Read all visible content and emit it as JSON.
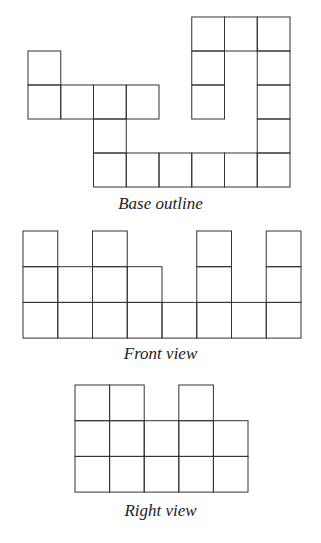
{
  "figures": [
    {
      "id": "base",
      "caption": "Base outline",
      "origin": [
        28,
        17
      ],
      "cell": [
        32.75,
        34
      ],
      "cells": [
        [
          5,
          0
        ],
        [
          6,
          0
        ],
        [
          7,
          0
        ],
        [
          0,
          1
        ],
        [
          5,
          1
        ],
        [
          7,
          1
        ],
        [
          0,
          2
        ],
        [
          1,
          2
        ],
        [
          2,
          2
        ],
        [
          3,
          2
        ],
        [
          5,
          2
        ],
        [
          7,
          2
        ],
        [
          2,
          3
        ],
        [
          7,
          3
        ],
        [
          2,
          4
        ],
        [
          3,
          4
        ],
        [
          4,
          4
        ],
        [
          5,
          4
        ],
        [
          6,
          4
        ],
        [
          7,
          4
        ]
      ]
    },
    {
      "id": "front",
      "caption": "Front view",
      "origin": [
        23,
        231
      ],
      "cell": [
        34.75,
        35.7
      ],
      "rows": 3,
      "column_heights": [
        3,
        2,
        3,
        2,
        1,
        3,
        1,
        3
      ]
    },
    {
      "id": "right",
      "caption": "Right view",
      "origin": [
        75,
        385
      ],
      "cell": [
        34.6,
        35.7
      ],
      "rows": 3,
      "column_heights": [
        3,
        3,
        2,
        3,
        2
      ]
    }
  ],
  "style": {
    "line_color": "#333333",
    "background": "#ffffff"
  }
}
